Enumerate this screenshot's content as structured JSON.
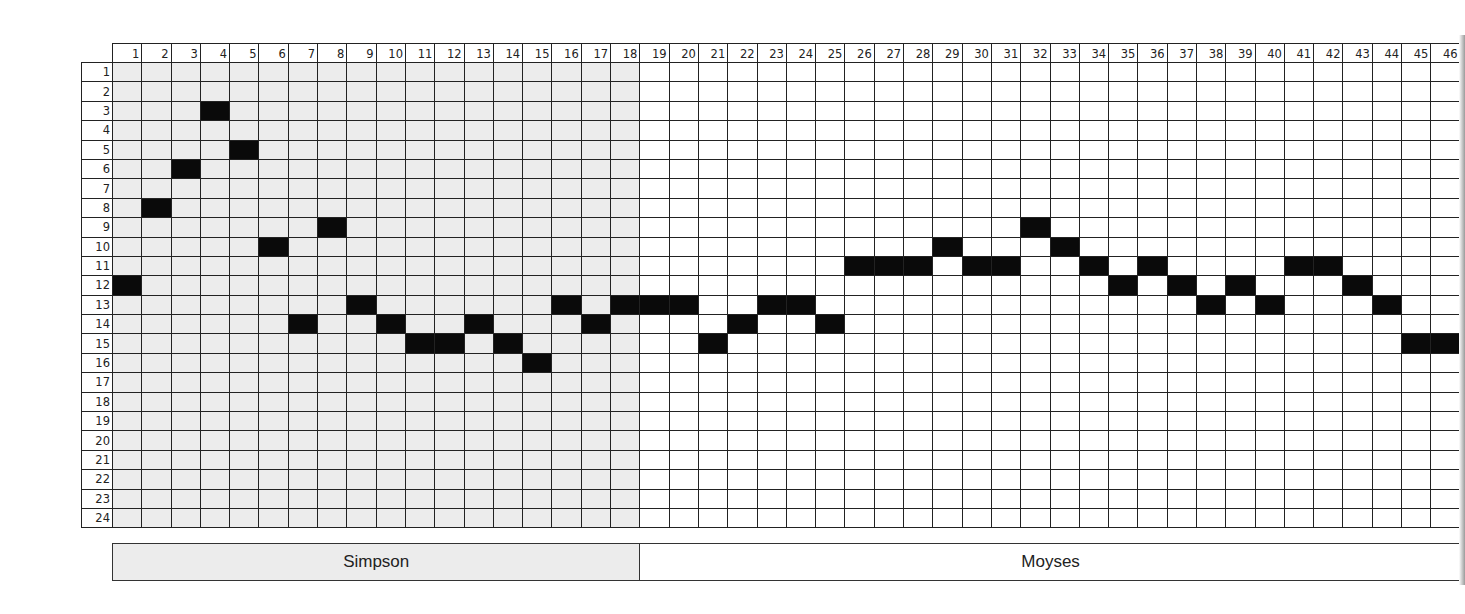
{
  "chart_data": {
    "type": "table",
    "title": "",
    "columns": [
      1,
      2,
      3,
      4,
      5,
      6,
      7,
      8,
      9,
      10,
      11,
      12,
      13,
      14,
      15,
      16,
      17,
      18,
      19,
      20,
      21,
      22,
      23,
      24,
      25,
      26,
      27,
      28,
      29,
      30,
      31,
      32,
      33,
      34,
      35,
      36,
      37,
      38,
      39,
      40,
      41,
      42,
      43,
      44,
      45,
      46
    ],
    "rows": [
      1,
      2,
      3,
      4,
      5,
      6,
      7,
      8,
      9,
      10,
      11,
      12,
      13,
      14,
      15,
      16,
      17,
      18,
      19,
      20,
      21,
      22,
      23,
      24
    ],
    "filled_row_by_column": [
      12,
      8,
      6,
      3,
      5,
      10,
      14,
      9,
      13,
      14,
      15,
      15,
      14,
      15,
      16,
      13,
      14,
      13,
      13,
      13,
      15,
      14,
      13,
      13,
      14,
      11,
      11,
      11,
      10,
      11,
      11,
      9,
      10,
      11,
      12,
      11,
      12,
      13,
      12,
      13,
      11,
      11,
      12,
      13,
      15,
      15
    ],
    "groups": [
      {
        "name": "Simpson",
        "from_column": 1,
        "to_column": 18,
        "shaded": true
      },
      {
        "name": "Moyses",
        "from_column": 19,
        "to_column": 46,
        "shaded": false
      }
    ],
    "xlabel": "",
    "ylabel": "",
    "grid": true,
    "colors": {
      "filled": "#0a0a0a",
      "shaded_bg": "#ececec",
      "plain_bg": "#ffffff",
      "line": "#222222"
    }
  },
  "legend": {
    "segments": [
      {
        "label": "Simpson",
        "columns": 18
      },
      {
        "label": "Moyses",
        "columns": 28
      }
    ]
  }
}
